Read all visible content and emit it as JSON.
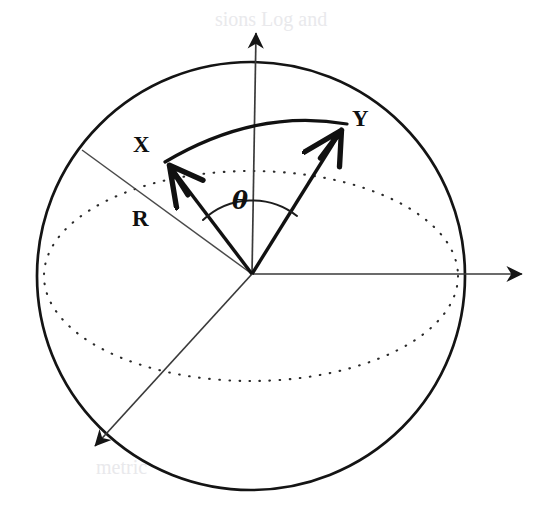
{
  "figure": {
    "background_color": "#ffffff",
    "ink_color": "#111111",
    "faint_color": "#e9e9ec",
    "width": 558,
    "height": 512
  },
  "labels": {
    "x_vector": "X",
    "y_vector": "Y",
    "radius": "R",
    "angle": "θ"
  },
  "geometry": {
    "sphere": {
      "cx": 251,
      "cy": 276,
      "r": 214,
      "stroke_width": 2.6
    },
    "equator_ellipse": {
      "cx": 251,
      "cy": 276,
      "rx": 207,
      "ry": 105,
      "style": "dotted"
    },
    "origin": {
      "x": 252,
      "y": 274
    },
    "axes": [
      {
        "name": "z-axis-up",
        "x2": 256,
        "y2": 25
      },
      {
        "name": "x-axis-right",
        "x2": 532,
        "y2": 274
      },
      {
        "name": "y-axis-front-left",
        "x2": 86,
        "y2": 454
      }
    ],
    "radius_line": {
      "x2": 82,
      "y2": 150
    },
    "vector_x_tip": {
      "x": 163,
      "y": 160
    },
    "vector_y_tip": {
      "x": 348,
      "y": 124
    },
    "geodesic_arc": {
      "from": "vector_x_tip",
      "to": "vector_y_tip",
      "bulge": "upward"
    },
    "angle_arc_radius": 72
  },
  "label_positions": {
    "x_vector": {
      "x": 133,
      "y": 152
    },
    "y_vector": {
      "x": 352,
      "y": 126
    },
    "radius": {
      "x": 132,
      "y": 226
    },
    "angle": {
      "x": 232,
      "y": 209
    }
  },
  "ghost_text": [
    {
      "text": "sions Log and",
      "x": 215,
      "y": 26
    },
    {
      "text": "metric",
      "x": 96,
      "y": 474
    }
  ]
}
